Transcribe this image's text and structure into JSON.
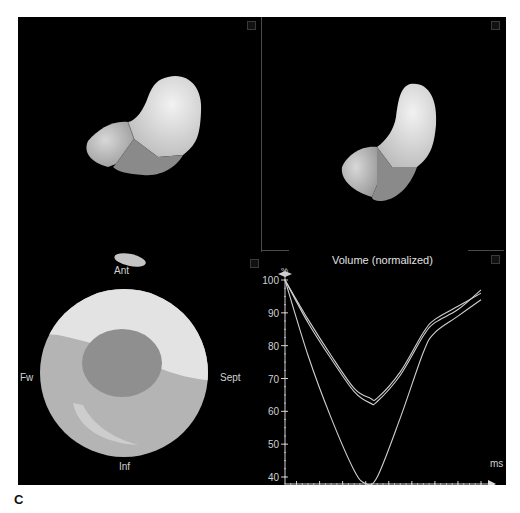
{
  "figure_label": "C",
  "panels": {
    "top_left": {
      "name": "3D LV model view 1"
    },
    "top_right": {
      "name": "3D LV model view 2"
    },
    "bottom_left": {
      "name": "Bullseye polar map",
      "labels": {
        "top": "Ant",
        "left": "Fw",
        "right": "Sept",
        "bottom": "Inf"
      }
    },
    "bottom_right": {
      "title": "Volume (normalized)",
      "y_unit": "%",
      "x_unit": "ms"
    }
  },
  "chart_data": {
    "type": "line",
    "title": "Volume (normalized)",
    "xlabel": "ms",
    "ylabel": "%",
    "x_ticks": [
      100,
      200,
      300,
      400,
      500,
      600,
      700,
      800,
      900
    ],
    "y_ticks": [
      40,
      50,
      60,
      70,
      80,
      90,
      100
    ],
    "xlim": [
      50,
      950
    ],
    "ylim": [
      38,
      102
    ],
    "grid": false,
    "legend": null,
    "series": [
      {
        "name": "curve-1",
        "x": [
          50,
          150,
          250,
          350,
          420,
          450,
          550,
          650,
          700,
          800,
          900
        ],
        "values": [
          100,
          88,
          77,
          67,
          64,
          64,
          72,
          84,
          88,
          92,
          96
        ]
      },
      {
        "name": "curve-2",
        "x": [
          50,
          150,
          250,
          350,
          420,
          450,
          550,
          650,
          700,
          800,
          900
        ],
        "values": [
          100,
          87,
          76,
          66,
          62.5,
          63,
          71,
          83,
          87,
          91,
          97
        ]
      },
      {
        "name": "curve-3",
        "x": [
          50,
          150,
          250,
          350,
          400,
          450,
          550,
          650,
          700,
          800,
          900
        ],
        "values": [
          100,
          77,
          58,
          42,
          38,
          40,
          58,
          78,
          84,
          89,
          94
        ]
      }
    ]
  }
}
